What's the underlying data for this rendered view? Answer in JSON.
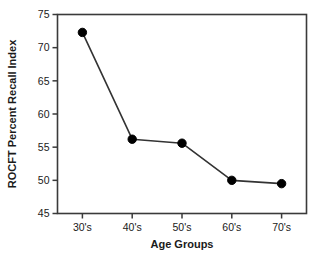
{
  "chart_data": {
    "type": "line",
    "title": "",
    "xlabel": "Age Groups",
    "ylabel": "ROCFT Percent Recall Index",
    "categories": [
      "30's",
      "40's",
      "50's",
      "60's",
      "70's"
    ],
    "values": [
      72.3,
      56.2,
      55.6,
      50.0,
      49.5
    ],
    "series": [
      {
        "name": "ROCFT Percent Recall Index",
        "values": [
          72.3,
          56.2,
          55.6,
          50.0,
          49.5
        ]
      }
    ],
    "ylim": [
      45,
      75
    ],
    "yticks": [
      "45",
      "50",
      "55",
      "60",
      "65",
      "70",
      "75"
    ],
    "ytick_values": [
      45,
      50,
      55,
      60,
      65,
      70,
      75
    ],
    "xtick_labels": [
      "30's",
      "40's",
      "50's",
      "60's",
      "70's"
    ],
    "grid": false,
    "legend": "none",
    "marker": "filled-circle",
    "line_color": "#333333",
    "marker_color": "#000000",
    "axis_color": "#3a3a3a",
    "background_color": "#ffffff"
  },
  "axes": {
    "x_title": "Age Groups",
    "y_title": "ROCFT Percent Recall Index"
  }
}
